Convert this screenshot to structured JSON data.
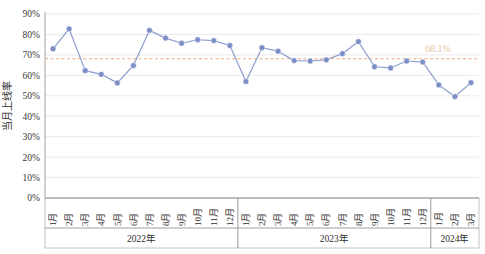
{
  "chart_data": {
    "type": "line",
    "title": "",
    "xlabel": "",
    "ylabel": "当月上线率",
    "ylim": [
      0,
      0.9
    ],
    "ytick_labels": [
      "0%",
      "10%",
      "20%",
      "30%",
      "40%",
      "50%",
      "60%",
      "70%",
      "80%",
      "90%"
    ],
    "ytick_values": [
      0,
      10,
      20,
      30,
      40,
      50,
      60,
      70,
      80,
      90
    ],
    "grid": true,
    "legend": "none",
    "categories": [
      "1月",
      "2月",
      "3月",
      "4月",
      "5月",
      "6月",
      "7月",
      "8月",
      "9月",
      "10月",
      "11月",
      "12月",
      "1月",
      "2月",
      "3月",
      "4月",
      "5月",
      "6月",
      "7月",
      "8月",
      "9月",
      "10月",
      "11月",
      "12月",
      "1月",
      "2月",
      "3月"
    ],
    "groups": [
      {
        "label": "2022年",
        "count": 12
      },
      {
        "label": "2023年",
        "count": 12
      },
      {
        "label": "2024年",
        "count": 3
      }
    ],
    "series": [
      {
        "name": "当月上线率",
        "color": "#7b8ec6",
        "values": [
          73.0,
          82.7,
          62.3,
          60.5,
          56.3,
          64.8,
          82.0,
          78.2,
          75.7,
          77.4,
          77.0,
          74.6,
          57.0,
          73.5,
          71.8,
          67.2,
          67.0,
          67.6,
          70.6,
          76.5,
          64.2,
          63.6,
          67.0,
          66.5,
          55.3,
          49.6,
          56.4
        ]
      }
    ],
    "reference_line": {
      "value": 68.1,
      "label": "68.1%",
      "color": "#e8a87c",
      "style": "dashed"
    },
    "colors": {
      "marker": "#7b8ec6",
      "line": "#8c9ccd",
      "grid": "#e9e9ef",
      "axis": "#9a9a9a",
      "reference": "#e8a87c",
      "reference_label": "#e8c39a"
    }
  }
}
